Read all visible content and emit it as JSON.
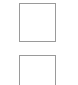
{
  "items": [
    {
      "type": "checkbox-square",
      "checked": false,
      "border_color": "#9a9a9a"
    },
    {
      "type": "checkbox-square",
      "checked": false,
      "border_color": "#9a9a9a"
    }
  ]
}
